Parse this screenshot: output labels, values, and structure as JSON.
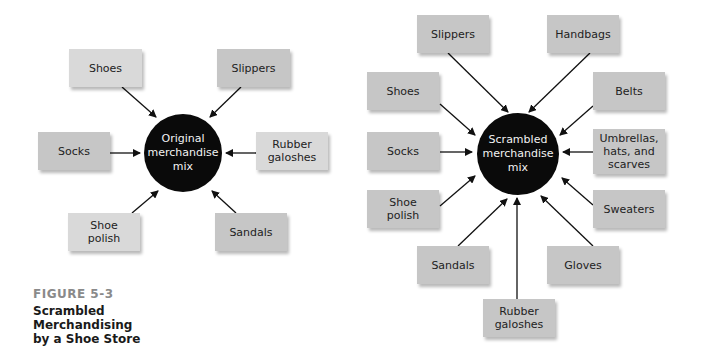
{
  "figure": {
    "label": "FIGURE 5-3",
    "title": "Scrambled\nMerchandising\nby a Shoe Store"
  },
  "original": {
    "hub": "Original\nmerchandise\nmix",
    "items": [
      "Shoes",
      "Slippers",
      "Socks",
      "Rubber\ngaloshes",
      "Shoe\npolish",
      "Sandals"
    ]
  },
  "scrambled": {
    "hub": "Scrambled\nmerchandise\nmix",
    "items": [
      "Slippers",
      "Handbags",
      "Shoes",
      "Belts",
      "Socks",
      "Umbrellas,\nhats, and\nscarves",
      "Shoe\npolish",
      "Sweaters",
      "Sandals",
      "Gloves",
      "Rubber\ngaloshes"
    ]
  },
  "colors": {
    "box_light": "#d9d9d9",
    "box_dark": "#c6c6c6",
    "hub": "#0a0a0a",
    "caption_label": "#8a8a8a"
  }
}
